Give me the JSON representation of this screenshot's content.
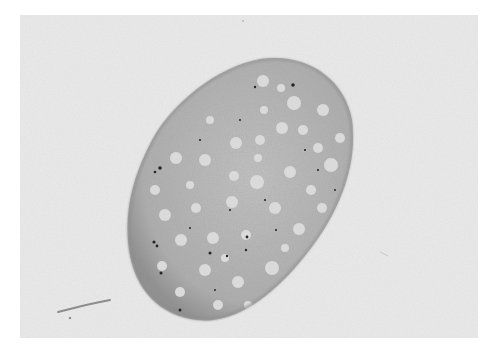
{
  "image": {
    "kind": "grayscale micrograph",
    "subject": "oval cell section with numerous pale vacuoles and dark granules",
    "colors": {
      "page_border": "#ffffff",
      "photo_background": "#ececec",
      "cell_body": "#b9b9b9",
      "cell_edge": "#8f8f8f",
      "vacuole": "#dcdcdc",
      "granule": "#222222",
      "streak": "#8a8a8a"
    }
  }
}
